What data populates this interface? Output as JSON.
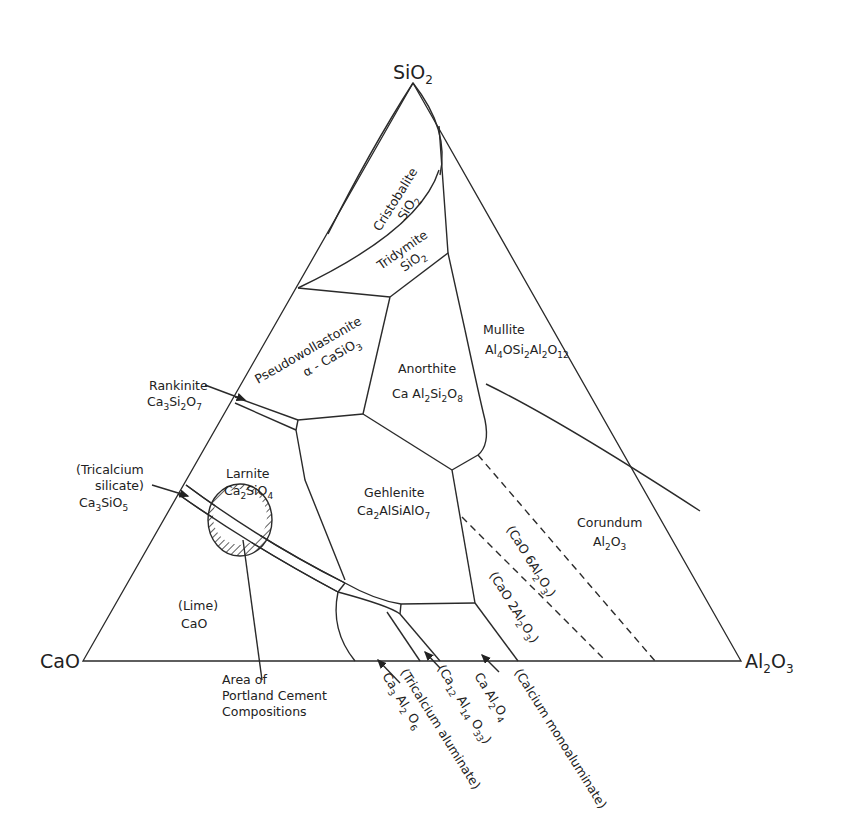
{
  "diagram": {
    "type": "ternary-phase-diagram",
    "vertices": {
      "top": {
        "text": "SiO",
        "sub": "2"
      },
      "left": {
        "text": "CaO"
      },
      "right": {
        "text": "Al",
        "sub1": "2",
        "mid": "O",
        "sub2": "3"
      }
    },
    "regions": {
      "cristobalite": {
        "name": "Cristobalite",
        "formula": "SiO",
        "sub": "2"
      },
      "tridymite": {
        "name": "Tridymite",
        "formula": "SiO",
        "sub": "2"
      },
      "pseudowollastonite": {
        "name": "Pseudowollastonite",
        "formula": "α - CaSiO",
        "sub": "3"
      },
      "anorthite": {
        "name": "Anorthite",
        "formula_parts": [
          "Ca Al",
          "2",
          "Si",
          "2",
          "O",
          "8"
        ]
      },
      "mullite": {
        "name": "Mullite",
        "formula_parts": [
          "Al",
          "4",
          "OSi",
          "2",
          "Al",
          "2",
          "O",
          "12"
        ]
      },
      "rankinite": {
        "name": "Rankinite",
        "formula_parts": [
          "Ca",
          "3",
          "Si",
          "2",
          "O",
          "7"
        ]
      },
      "tricalcium_silicate": {
        "line1": "(Tricalcium",
        "line2": "silicate)",
        "formula_parts": [
          "Ca",
          "3",
          "SiO",
          "5"
        ]
      },
      "larnite": {
        "name": "Larnite",
        "formula_parts": [
          "Ca",
          "2",
          "SiO",
          "4"
        ]
      },
      "gehlenite": {
        "name": "Gehlenite",
        "formula_parts": [
          "Ca",
          "2",
          "AlSiAlO",
          "7"
        ]
      },
      "corundum": {
        "name": "Corundum",
        "formula_parts": [
          "Al",
          "2",
          "O",
          "3"
        ]
      },
      "lime": {
        "name": "(Lime)",
        "formula": "CaO"
      },
      "cao6al2o3": {
        "parts": [
          "(CaO 6Al",
          "2",
          "O",
          "3",
          ")"
        ]
      },
      "cao2al2o3": {
        "parts": [
          "(CaO 2Al",
          "2",
          "O",
          "3",
          ")"
        ]
      }
    },
    "bottom_labels": {
      "portland": {
        "line1": "Area   of",
        "line2": "Portland  Cement",
        "line3": "Compositions"
      },
      "tricalcium_aluminate": {
        "name": "(Tricalcium  aluminate)",
        "formula_parts": [
          "Ca",
          "3",
          " Al",
          "2",
          " O",
          "6"
        ]
      },
      "c12a7": {
        "parts": [
          "(Ca",
          "12",
          " Al",
          "14",
          " O",
          "33",
          ")"
        ]
      },
      "monoaluminate": {
        "name": "(Calcium  monoaluminate)",
        "formula_parts": [
          "Ca Al",
          "2",
          "O",
          "4"
        ]
      }
    },
    "colors": {
      "line": "#2a2a2a",
      "background": "#ffffff",
      "hatch": "#333333"
    }
  }
}
